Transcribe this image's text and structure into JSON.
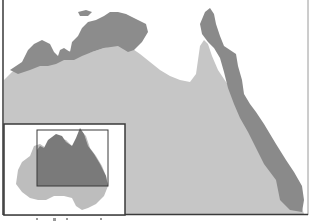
{
  "map": {
    "region": "Northern Australia",
    "colors": {
      "sea": "#ffffff",
      "land": "#c4c4c4",
      "highlighted_region": "#8a8a8a",
      "border": "#3a3a3a",
      "inset_land": "#bdbdbd",
      "inset_highlight": "#7a7a7a"
    },
    "layers": [
      {
        "name": "main-land",
        "description": "Northern Australian landmass"
      },
      {
        "name": "northern-coast-region",
        "description": "Dark band along Top End coast"
      },
      {
        "name": "eastern-coast-region",
        "description": "Dark band along Cape York and Queensland east coast"
      }
    ],
    "inset": {
      "description": "Australia overview with locator rectangle over northern region"
    }
  }
}
